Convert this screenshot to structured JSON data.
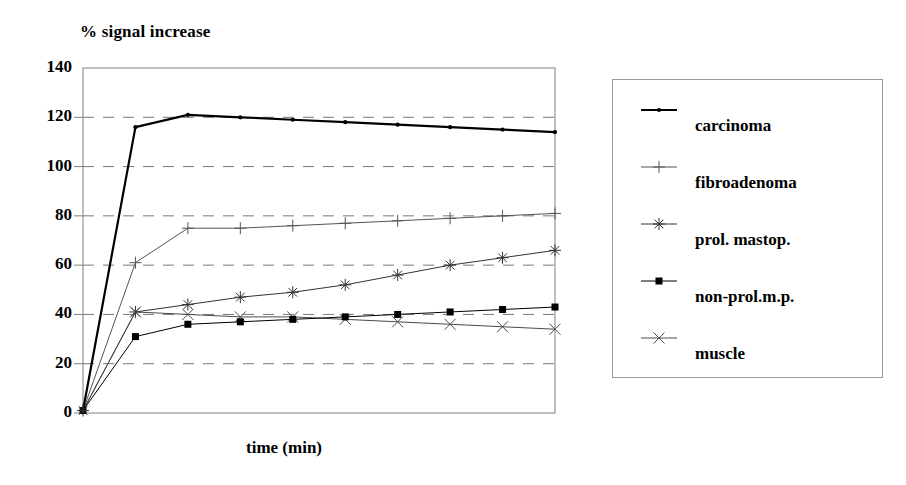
{
  "chart_data": {
    "type": "line",
    "title": "% signal increase",
    "xlabel": "time  (min)",
    "ylabel": "",
    "ylim": [
      0,
      140
    ],
    "yticks": [
      0,
      20,
      40,
      60,
      80,
      100,
      120,
      140
    ],
    "ytick_labels": [
      "0",
      "20",
      "40",
      "60",
      "80",
      "100",
      "120",
      "140"
    ],
    "xtick_labels": [],
    "grid": "horizontal-dashed",
    "legend_position": "right-outside",
    "x": [
      0,
      1,
      2,
      3,
      4,
      5,
      6,
      7,
      8,
      9
    ],
    "series": [
      {
        "name": "carcinoma",
        "marker": "dot",
        "color": "#000000",
        "line_width": 2.2,
        "values": [
          1,
          116,
          121,
          120,
          119,
          118,
          117,
          116,
          115,
          114
        ]
      },
      {
        "name": "fibroadenoma",
        "marker": "plus",
        "color": "#555555",
        "line_width": 1,
        "values": [
          1,
          61,
          75,
          75,
          76,
          77,
          78,
          79,
          80,
          81
        ]
      },
      {
        "name": "prol. mastop.",
        "marker": "star",
        "color": "#333333",
        "line_width": 1,
        "values": [
          1,
          41,
          44,
          47,
          49,
          52,
          56,
          60,
          63,
          66
        ]
      },
      {
        "name": "non-prol.m.p.",
        "marker": "square",
        "color": "#000000",
        "line_width": 1,
        "values": [
          1,
          31,
          36,
          37,
          38,
          39,
          40,
          41,
          42,
          43
        ]
      },
      {
        "name": "muscle",
        "marker": "cross",
        "color": "#4a4a4a",
        "line_width": 1,
        "values": [
          1,
          41,
          40,
          39,
          39,
          38,
          37,
          36,
          35,
          34
        ]
      }
    ]
  },
  "legend": {
    "items": [
      {
        "label": "carcinoma",
        "marker": "dot"
      },
      {
        "label": "fibroadenoma",
        "marker": "plus"
      },
      {
        "label": "prol. mastop.",
        "marker": "star"
      },
      {
        "label": "non-prol.m.p.",
        "marker": "square"
      },
      {
        "label": "muscle",
        "marker": "cross"
      }
    ]
  },
  "colors": {
    "axis": "#808080",
    "grid": "#777777",
    "text": "#000000",
    "legend_border": "#9a9a9a"
  }
}
